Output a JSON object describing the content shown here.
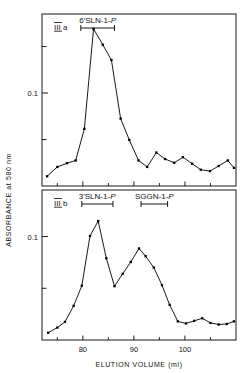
{
  "figure": {
    "axis_titles": {
      "y": "ABSORBANCE  at 580 nm",
      "x": "ELUTION VOLUME (ml)"
    },
    "x_ticks": [
      "80",
      "90",
      "100"
    ],
    "accent_color": "#000000"
  },
  "chart_data": [
    {
      "type": "line",
      "panel": "III a",
      "title": "",
      "xlabel": "ELUTION VOLUME (ml)",
      "ylabel": "ABSORBANCE at 580 nm",
      "xlim": [
        72,
        110
      ],
      "ylim": [
        0,
        0.185
      ],
      "xticks": [
        80,
        90,
        100
      ],
      "yticks": [
        0.1
      ],
      "ytick_labels": [
        "0.1"
      ],
      "grid": false,
      "legend": "none",
      "annotations": [
        {
          "text": "6'SLN-1-P",
          "x_start": 79.6,
          "x_end": 86.2,
          "label_x": 82.9,
          "type": "range-bar"
        }
      ],
      "x": [
        73.0,
        75.0,
        76.9,
        78.6,
        80.3,
        82.1,
        83.9,
        85.6,
        87.4,
        89.1,
        90.9,
        92.6,
        94.4,
        96.1,
        97.9,
        99.6,
        101.4,
        103.1,
        104.9,
        106.6,
        108.4,
        109.6
      ],
      "y": [
        0.0105,
        0.0205,
        0.0245,
        0.0275,
        0.0615,
        0.169,
        0.152,
        0.1355,
        0.0725,
        0.0495,
        0.0275,
        0.0205,
        0.036,
        0.029,
        0.025,
        0.031,
        0.024,
        0.0175,
        0.016,
        0.0215,
        0.0275,
        0.0195
      ]
    },
    {
      "type": "line",
      "panel": "III b",
      "title": "",
      "xlabel": "ELUTION VOLUME (ml)",
      "ylabel": "ABSORBANCE at 580 nm",
      "xlim": [
        72,
        110
      ],
      "ylim": [
        0,
        0.145
      ],
      "xticks": [
        80,
        90,
        100
      ],
      "yticks": [
        0.1
      ],
      "ytick_labels": [
        "0.1"
      ],
      "grid": false,
      "legend": "none",
      "annotations": [
        {
          "text": "3'SLN-1-P",
          "x_start": 79.8,
          "x_end": 85.9,
          "label_x": 82.8,
          "type": "range-bar"
        },
        {
          "text": "SGGN-1-P",
          "x_start": 91.4,
          "x_end": 96.6,
          "label_x": 94.0,
          "type": "range-bar"
        }
      ],
      "x": [
        73.2,
        75.0,
        76.5,
        78.2,
        79.8,
        81.4,
        83.0,
        84.6,
        86.2,
        87.8,
        89.4,
        91.0,
        92.3,
        93.9,
        95.5,
        97.0,
        98.6,
        100.2,
        101.8,
        103.4,
        105.0,
        106.6,
        108.2,
        109.6
      ],
      "y": [
        0.007,
        0.012,
        0.0175,
        0.033,
        0.0525,
        0.1005,
        0.115,
        0.079,
        0.052,
        0.064,
        0.0755,
        0.0885,
        0.081,
        0.07,
        0.053,
        0.034,
        0.018,
        0.016,
        0.0185,
        0.021,
        0.0165,
        0.015,
        0.0155,
        0.018
      ]
    }
  ],
  "panels": {
    "top": {
      "label": "III a"
    },
    "bottom": {
      "label": "III b"
    }
  }
}
